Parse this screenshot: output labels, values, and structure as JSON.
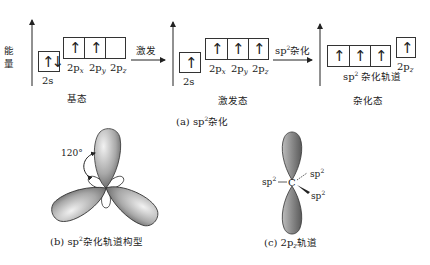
{
  "figure_a": {
    "energy_label": "能量",
    "ground_state": {
      "title": "基态",
      "s_label": "2s",
      "p_labels": [
        "2p",
        "2p",
        "2p"
      ],
      "p_subscripts": [
        "x",
        "y",
        "z"
      ],
      "s_electrons": "↑↓",
      "p_electrons": [
        "↑",
        "↑",
        ""
      ]
    },
    "arrow1_label": "激发",
    "excited_state": {
      "title": "激发态",
      "s_label": "2s",
      "p_labels": [
        "2p",
        "2p",
        "2p"
      ],
      "p_subscripts": [
        "x",
        "y",
        "z"
      ],
      "s_electrons": "↑",
      "p_electrons": [
        "↑",
        "↑",
        "↑"
      ]
    },
    "arrow2_label_sp": "sp",
    "arrow2_label_sup": "2",
    "arrow2_label_zh": "杂化",
    "hybrid_state": {
      "title": "杂化态",
      "hybrid_label_sp": "sp",
      "hybrid_label_sup": "2",
      "hybrid_label_zh": " 杂化轨道",
      "pz_label": "2p",
      "pz_sub": "z",
      "hybrid_electrons": [
        "↑",
        "↑",
        "↑"
      ],
      "pz_electron": "↑"
    },
    "caption_prefix": "(a) sp",
    "caption_sup": "2",
    "caption_zh": "杂化"
  },
  "figure_b": {
    "angle_label": "120°",
    "caption_prefix": "(b) sp",
    "caption_sup": "2",
    "caption_zh": "杂化轨道构型"
  },
  "figure_c": {
    "center_atom": "C",
    "bond_labels": [
      "sp",
      "sp",
      "sp"
    ],
    "bond_sup": "2",
    "caption_prefix": "(c) 2p",
    "caption_sub": "z",
    "caption_zh": "轨道"
  }
}
